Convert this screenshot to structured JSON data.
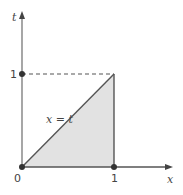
{
  "diagram": {
    "type": "region-plot",
    "axes": {
      "x_label": "x",
      "y_label": "t",
      "origin_label": "0",
      "x_tick_label": "1",
      "y_tick_label": "1"
    },
    "line_label": "x = t",
    "region": {
      "description": "triangle bounded by t = 0, x = 1, and x = t",
      "vertices": [
        [
          0,
          0
        ],
        [
          1,
          0
        ],
        [
          1,
          1
        ]
      ]
    },
    "dashed_guide": {
      "from": [
        0,
        1
      ],
      "to": [
        1,
        1
      ]
    },
    "points": [
      {
        "name": "origin",
        "x": 0,
        "t": 0
      },
      {
        "name": "x-one",
        "x": 1,
        "t": 0
      },
      {
        "name": "t-one",
        "x": 0,
        "t": 1
      }
    ],
    "colors": {
      "axis": "#555555",
      "region_fill": "#e2e2e2",
      "line": "#555555",
      "dashed": "#555555",
      "text": "#444444"
    }
  }
}
